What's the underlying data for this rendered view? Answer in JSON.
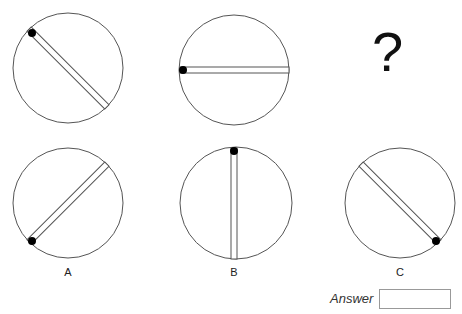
{
  "question": {
    "prompt_symbol": "?",
    "sequence": [
      {
        "name": "figure-1",
        "bar_angle_deg": 45,
        "dot_position": "upper-left"
      },
      {
        "name": "figure-2",
        "bar_angle_deg": 0,
        "dot_position": "left"
      }
    ]
  },
  "options": [
    {
      "label": "A",
      "bar_angle_deg": -45,
      "dot_position": "lower-left"
    },
    {
      "label": "B",
      "bar_angle_deg": 90,
      "dot_position": "top"
    },
    {
      "label": "C",
      "bar_angle_deg": 45,
      "dot_position": "lower-right"
    }
  ],
  "answer": {
    "label": "Answer",
    "value": ""
  },
  "colors": {
    "stroke": "#555555",
    "dot": "#000000"
  }
}
